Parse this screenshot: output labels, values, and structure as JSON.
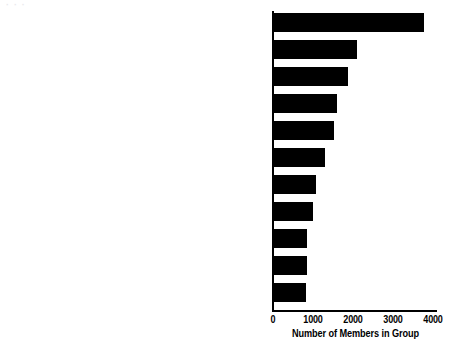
{
  "artifact": {
    "text": "· · ·"
  },
  "chart_data": {
    "type": "bar",
    "orientation": "horizontal",
    "title": "",
    "xlabel": "Number of Members in Group",
    "ylabel": "",
    "xlim": [
      0,
      4000
    ],
    "xticks": [
      0,
      1000,
      2000,
      3000,
      4000
    ],
    "xtick_labels": [
      "0",
      "1000",
      "2000",
      "3000",
      "4000"
    ],
    "grid": false,
    "legend": null,
    "bar_color": "#000000",
    "categories": [
      "Vote for MMP",
      "I'm voting in Ontario – October 10",
      "Green Party of Ontario",
      "We support an Ontario Student Strike",
      "Ontario Highway of Heroes Petition – Support our Troops.",
      "Raise the minimum wage in Ontario to $10 an hour NOW.",
      "You Know You Are From Ontario When....",
      "I'm saying YES to democracy\nand NO to MMP in the October 10th referendum!",
      "Freeze Ontario Tuition",
      "Stop Unfair Fees.ca",
      "Your Big Decision"
    ],
    "values": [
      3780,
      2100,
      1880,
      1600,
      1530,
      1300,
      1080,
      1000,
      850,
      840,
      830
    ]
  }
}
